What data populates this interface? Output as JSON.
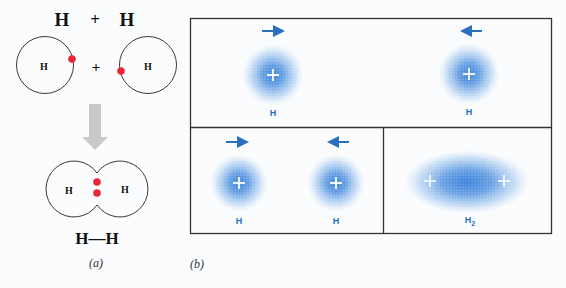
{
  "panel_a": {
    "top_equation": {
      "left": "H",
      "plus": "+",
      "right": "H"
    },
    "atom_left_label": "H",
    "atom_right_label": "H",
    "middle_plus": "+",
    "molecule_left_label": "H",
    "molecule_right_label": "H",
    "bond_formula": "H—H",
    "caption": "(a)",
    "colors": {
      "electron": "#e8283a",
      "orbit": "#222222",
      "arrow": "#c8c8c8"
    }
  },
  "panel_b": {
    "caption": "(b)",
    "top_box": {
      "left_atom": {
        "label": "H",
        "arrow": "right"
      },
      "right_atom": {
        "label": "H",
        "arrow": "left"
      }
    },
    "bottom_left_box": {
      "left_atom": {
        "label": "H",
        "arrow": "right"
      },
      "right_atom": {
        "label": "H",
        "arrow": "left"
      }
    },
    "bottom_right_box": {
      "molecule": {
        "label": "H",
        "subscript": "2"
      }
    },
    "nucleus_symbol": "+",
    "colors": {
      "cloud": "#2f7ad6",
      "arrow": "#2a6fc0",
      "border": "#333333"
    }
  }
}
